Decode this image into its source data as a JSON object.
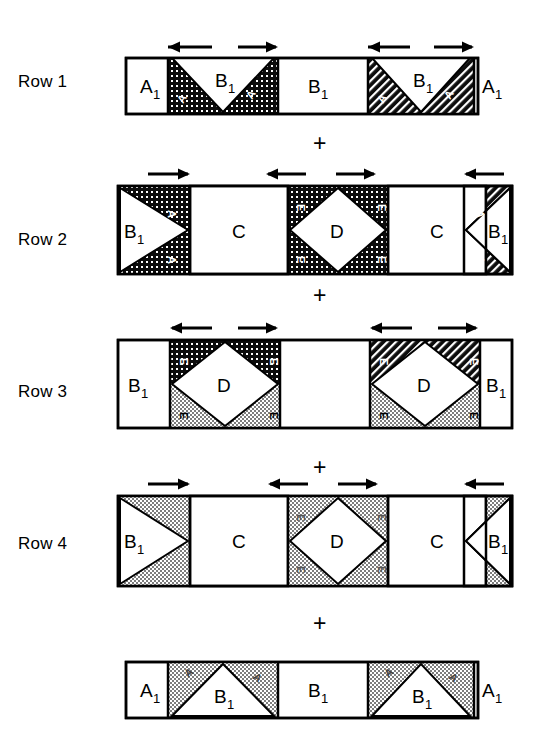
{
  "figure": {
    "type": "structural-tiling-diagram",
    "rows": [
      {
        "label": "Row 1",
        "cells": [
          {
            "name": "A1",
            "base": "A",
            "sub": "1",
            "fill": "white"
          },
          {
            "name": "A2",
            "base": "A",
            "sub": "2",
            "fill": "dark-dotted"
          },
          {
            "name": "B1",
            "base": "B",
            "sub": "1",
            "fill": "white"
          },
          {
            "name": "A2",
            "base": "A",
            "sub": "2",
            "fill": "dark-dotted"
          },
          {
            "name": "B1",
            "base": "B",
            "sub": "1",
            "fill": "white"
          },
          {
            "name": "A2",
            "base": "A",
            "sub": "2",
            "fill": "dark-dotted"
          },
          {
            "name": "B1",
            "base": "B",
            "sub": "1",
            "fill": "white"
          },
          {
            "name": "A2",
            "base": "A",
            "sub": "2",
            "fill": "dark-dotted"
          },
          {
            "name": "A1",
            "base": "A",
            "sub": "1",
            "fill": "white"
          }
        ],
        "arrows": [
          "left",
          "right",
          "left",
          "right"
        ]
      },
      {
        "label": "Row 2",
        "cells": [
          {
            "name": "B1",
            "base": "B",
            "sub": "1",
            "fill": "white"
          },
          {
            "name": "A2",
            "base": "A",
            "sub": "2",
            "fill": "dark-dotted"
          },
          {
            "name": "C",
            "base": "C",
            "sub": "",
            "fill": "white"
          },
          {
            "name": "E",
            "base": "E",
            "sub": "",
            "fill": "dark-dotted"
          },
          {
            "name": "D",
            "base": "D",
            "sub": "",
            "fill": "white"
          },
          {
            "name": "E",
            "base": "E",
            "sub": "",
            "fill": "dark-dotted"
          },
          {
            "name": "C",
            "base": "C",
            "sub": "",
            "fill": "white"
          },
          {
            "name": "A2",
            "base": "A",
            "sub": "2",
            "fill": "dark-dotted"
          },
          {
            "name": "B1",
            "base": "B",
            "sub": "1",
            "fill": "white"
          }
        ],
        "arrows": [
          "right",
          "left",
          "right",
          "left"
        ]
      },
      {
        "label": "Row 3",
        "cells": [
          {
            "name": "B1",
            "base": "B",
            "sub": "1",
            "fill": "white"
          },
          {
            "name": "E",
            "base": "E",
            "sub": "",
            "fill": "dark-dotted"
          },
          {
            "name": "D",
            "base": "D",
            "sub": "",
            "fill": "white"
          },
          {
            "name": "E",
            "base": "E",
            "sub": "",
            "fill": "gray-dotted"
          },
          {
            "name": "E",
            "base": "E",
            "sub": "",
            "fill": "dark-dotted"
          },
          {
            "name": "D",
            "base": "D",
            "sub": "",
            "fill": "white"
          },
          {
            "name": "E",
            "base": "E",
            "sub": "",
            "fill": "gray-dotted"
          },
          {
            "name": "B1",
            "base": "B",
            "sub": "1",
            "fill": "white"
          }
        ],
        "arrows": [
          "left",
          "right",
          "left",
          "right"
        ]
      },
      {
        "label": "Row 4",
        "cells": [
          {
            "name": "B1",
            "base": "B",
            "sub": "1",
            "fill": "white"
          },
          {
            "name": "C",
            "base": "C",
            "sub": "",
            "fill": "white"
          },
          {
            "name": "E",
            "base": "E",
            "sub": "",
            "fill": "gray-dotted"
          },
          {
            "name": "D",
            "base": "D",
            "sub": "",
            "fill": "white"
          },
          {
            "name": "E",
            "base": "E",
            "sub": "",
            "fill": "gray-dotted"
          },
          {
            "name": "C",
            "base": "C",
            "sub": "",
            "fill": "white"
          },
          {
            "name": "B1",
            "base": "B",
            "sub": "1",
            "fill": "white"
          }
        ],
        "arrows": [
          "right",
          "left",
          "right",
          "left"
        ]
      },
      {
        "label": "",
        "cells": [
          {
            "name": "A1",
            "base": "A",
            "sub": "1",
            "fill": "white"
          },
          {
            "name": "B1",
            "base": "B",
            "sub": "1",
            "fill": "white"
          },
          {
            "name": "B1",
            "base": "B",
            "sub": "1",
            "fill": "white"
          },
          {
            "name": "B1",
            "base": "B",
            "sub": "1",
            "fill": "white"
          },
          {
            "name": "A1",
            "base": "A",
            "sub": "1",
            "fill": "white"
          }
        ],
        "arrows": []
      }
    ],
    "operators": [
      "+",
      "+",
      "+",
      "+"
    ],
    "labels": {
      "row1": "Row 1",
      "row2": "Row 2",
      "row3": "Row 3",
      "row4": "Row 4",
      "A": "A",
      "B": "B",
      "C": "C",
      "D": "D",
      "E": "E",
      "sub1": "1",
      "sub2": "2",
      "plus": "+"
    },
    "colors": {
      "ink": "#000000",
      "paper": "#ffffff",
      "dark_pattern": "#101010",
      "gray_pattern": "#9a9a9a"
    }
  }
}
